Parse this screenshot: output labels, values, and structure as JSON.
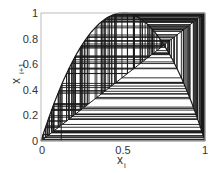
{
  "chart_data": {
    "type": "line",
    "title": "",
    "xlabel": "x",
    "xlabel_sub": "i",
    "ylabel": "x",
    "ylabel_sub": "i+1",
    "xlim": [
      0,
      1
    ],
    "ylim": [
      0,
      1
    ],
    "xticks": [
      0,
      0.5,
      1
    ],
    "xtick_labels": [
      "0",
      "0.5",
      "1"
    ],
    "yticks": [
      0,
      0.2,
      0.4,
      0.6,
      0.8,
      1
    ],
    "ytick_labels": [
      "0",
      "0.2",
      "0.4",
      "0.6",
      "0.8",
      "1"
    ],
    "grid": false,
    "series": [
      {
        "name": "map curve",
        "function": "r*x*(1-x)",
        "r": 4
      },
      {
        "name": "identity",
        "function": "x"
      },
      {
        "name": "cobweb",
        "x0": 0.1234,
        "iterations": 140,
        "r": 3.999
      }
    ],
    "colors": {
      "lines": "#1a1a1a",
      "axes": "#bbbbbb",
      "text": "#333333"
    }
  }
}
